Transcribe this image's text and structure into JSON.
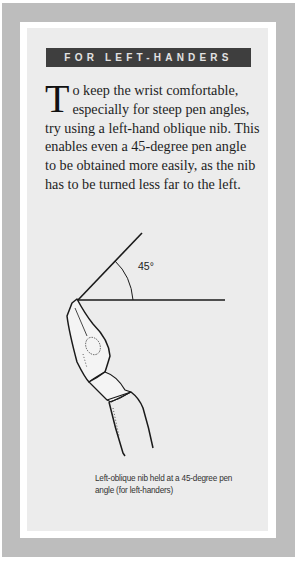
{
  "sidebar_box": {
    "header": "FOR LEFT-HANDERS",
    "drop_cap": "T",
    "body": "o keep the wrist comfortable, especially for steep pen angles, try using a left-hand oblique nib. This enables even a 45-degree pen angle to be obtained more easily, as the nib has to be turned less far to the left.",
    "diagram": {
      "angle_label": "45°",
      "icon": "pen-nib-illustration"
    },
    "caption": "Left-oblique nib held at a 45-degree pen angle (for left-handers)"
  },
  "colors": {
    "outer_border": "#bdbdbd",
    "frame": "#ffffff",
    "panel": "#ececec",
    "header_bg": "#3e3e3e",
    "header_text": "#e2e2e2"
  }
}
